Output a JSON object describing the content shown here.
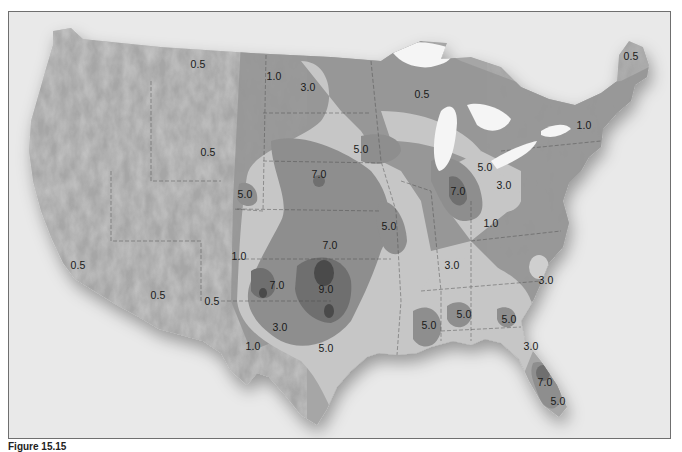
{
  "figure": {
    "caption": "Figure 15.15",
    "type": "isopleth map of the contiguous United States (grayscale shaded contours over shaded relief)"
  },
  "colors": {
    "background": "#e9e9e9",
    "frame_border": "#6f6f6f",
    "land_relief": "#a9a9a9",
    "contour_0_5": "#9d9d9d",
    "contour_1_0": "#959595",
    "contour_3_0": "#c4c4c4",
    "contour_5_0": "#8c8c8c",
    "contour_7_0": "#6d6d6d",
    "contour_9_0": "#4a4a4a",
    "lakes": "#f4f4f4",
    "label_text": "#1a1a1a"
  },
  "contour_levels": [
    "0.5",
    "1.0",
    "3.0",
    "5.0",
    "7.0",
    "9.0"
  ],
  "labels": [
    {
      "text": "0.5",
      "x": 197,
      "y": 63,
      "region": "northern-rockies"
    },
    {
      "text": "1.0",
      "x": 273,
      "y": 75,
      "region": "north-dakota"
    },
    {
      "text": "3.0",
      "x": 307,
      "y": 86,
      "region": "north-dakota-east"
    },
    {
      "text": "0.5",
      "x": 421,
      "y": 93,
      "region": "wisconsin-north"
    },
    {
      "text": "0.5",
      "x": 630,
      "y": 55,
      "region": "maine"
    },
    {
      "text": "1.0",
      "x": 583,
      "y": 124,
      "region": "new-york"
    },
    {
      "text": "0.5",
      "x": 207,
      "y": 151,
      "region": "wyoming"
    },
    {
      "text": "5.0",
      "x": 360,
      "y": 148,
      "region": "iowa-north"
    },
    {
      "text": "7.0",
      "x": 318,
      "y": 173,
      "region": "nebraska-east"
    },
    {
      "text": "5.0",
      "x": 484,
      "y": 166,
      "region": "ohio-northwest"
    },
    {
      "text": "7.0",
      "x": 457,
      "y": 190,
      "region": "indiana"
    },
    {
      "text": "3.0",
      "x": 503,
      "y": 184,
      "region": "ohio"
    },
    {
      "text": "5.0",
      "x": 244,
      "y": 193,
      "region": "colorado-east"
    },
    {
      "text": "1.0",
      "x": 490,
      "y": 222,
      "region": "kentucky-east"
    },
    {
      "text": "5.0",
      "x": 388,
      "y": 225,
      "region": "missouri"
    },
    {
      "text": "7.0",
      "x": 329,
      "y": 244,
      "region": "kansas-south"
    },
    {
      "text": "1.0",
      "x": 238,
      "y": 255,
      "region": "new-mexico-north"
    },
    {
      "text": "0.5",
      "x": 77,
      "y": 264,
      "region": "southern-california"
    },
    {
      "text": "3.0",
      "x": 451,
      "y": 264,
      "region": "tennessee"
    },
    {
      "text": "3.0",
      "x": 545,
      "y": 279,
      "region": "north-carolina"
    },
    {
      "text": "7.0",
      "x": 276,
      "y": 284,
      "region": "oklahoma-panhandle"
    },
    {
      "text": "9.0",
      "x": 325,
      "y": 288,
      "region": "oklahoma"
    },
    {
      "text": "0.5",
      "x": 157,
      "y": 294,
      "region": "arizona"
    },
    {
      "text": "0.5",
      "x": 211,
      "y": 300,
      "region": "new-mexico-west"
    },
    {
      "text": "5.0",
      "x": 463,
      "y": 313,
      "region": "alabama"
    },
    {
      "text": "5.0",
      "x": 508,
      "y": 318,
      "region": "georgia"
    },
    {
      "text": "5.0",
      "x": 428,
      "y": 324,
      "region": "mississippi"
    },
    {
      "text": "3.0",
      "x": 279,
      "y": 326,
      "region": "texas-west"
    },
    {
      "text": "1.0",
      "x": 252,
      "y": 345,
      "region": "texas-big-bend"
    },
    {
      "text": "5.0",
      "x": 325,
      "y": 347,
      "region": "texas-central"
    },
    {
      "text": "3.0",
      "x": 530,
      "y": 345,
      "region": "north-florida"
    },
    {
      "text": "7.0",
      "x": 544,
      "y": 381,
      "region": "central-florida"
    },
    {
      "text": "5.0",
      "x": 557,
      "y": 400,
      "region": "south-florida"
    }
  ]
}
